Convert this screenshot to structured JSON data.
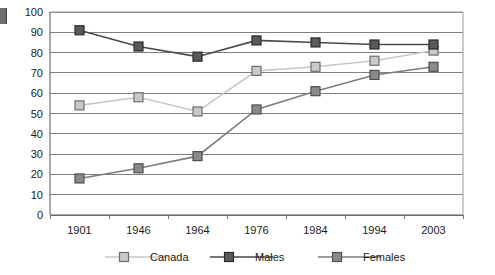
{
  "chart_data": {
    "type": "line",
    "title": "",
    "subtitle": "",
    "xlabel": "",
    "ylabel": "",
    "categories": [
      "1901",
      "1946",
      "1964",
      "1976",
      "1984",
      "1994",
      "2003"
    ],
    "series": [
      {
        "name": "Canada",
        "color": "#c8c8c8",
        "marker_fill": "#c9c9c9",
        "marker_stroke": "#6e6e6e",
        "values": [
          54,
          58,
          51,
          71,
          73,
          76,
          81
        ]
      },
      {
        "name": "Males",
        "color": "#4a4a4a",
        "marker_fill": "#5a5a5a",
        "marker_stroke": "#2a2a2a",
        "values": [
          91,
          83,
          78,
          86,
          85,
          84,
          84
        ]
      },
      {
        "name": "Females",
        "color": "#7d7d7d",
        "marker_fill": "#8a8a8a",
        "marker_stroke": "#4f4f4f",
        "values": [
          18,
          23,
          29,
          52,
          61,
          69,
          73
        ]
      }
    ],
    "yticks": [
      0,
      10,
      20,
      30,
      40,
      50,
      60,
      70,
      80,
      90,
      100
    ],
    "ytick_labels": [
      "0",
      "10",
      "20",
      "30",
      "40",
      "50",
      "60",
      "70",
      "80",
      "90",
      "100"
    ],
    "ylim": [
      0,
      100
    ],
    "grid": true,
    "grid_color": "#808080",
    "axis_color": "#555555",
    "legend": {
      "position": "bottom",
      "entries": [
        "Canada",
        "Males",
        "Females"
      ]
    }
  }
}
